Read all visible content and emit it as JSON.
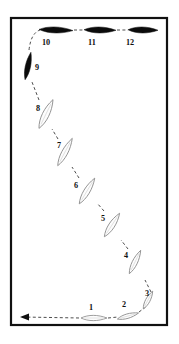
{
  "figure": {
    "title": "",
    "frame": {
      "x": 11,
      "y": 18,
      "width": 156,
      "height": 307,
      "border_color": "#111111",
      "background_color": "#ffffff"
    },
    "style": {
      "open_fill": "#fdfdfd",
      "open_stroke": "#8e8e8e",
      "solid_fill": "#0b0b0b",
      "connector_color": "#3a3a3a",
      "label_color": "#101010"
    },
    "direction_arrow": {
      "name": "flow-arrow",
      "points_to": "left",
      "tip_x": 20,
      "tip_y": 317,
      "tail_x": 46,
      "tail_y": 317
    },
    "items": [
      {
        "id": 1,
        "label": "1",
        "type": "open",
        "cx": 94,
        "cy": 318,
        "length": 26,
        "width": 7,
        "angle": 0,
        "label_x": 89,
        "label_y": 310
      },
      {
        "id": 2,
        "label": "2",
        "type": "open",
        "cx": 128,
        "cy": 316,
        "length": 22,
        "width": 6,
        "angle": -16,
        "label_x": 122,
        "label_y": 307
      },
      {
        "id": 3,
        "label": "3",
        "type": "open",
        "cx": 148,
        "cy": 300,
        "length": 20,
        "width": 6,
        "angle": -62,
        "label_x": 145,
        "label_y": 296
      },
      {
        "id": 4,
        "label": "4",
        "type": "open",
        "cx": 135,
        "cy": 262,
        "length": 26,
        "width": 7,
        "angle": -64,
        "label_x": 124,
        "label_y": 258
      },
      {
        "id": 5,
        "label": "5",
        "type": "open",
        "cx": 112,
        "cy": 225,
        "length": 28,
        "width": 8,
        "angle": -57,
        "label_x": 101,
        "label_y": 221
      },
      {
        "id": 6,
        "label": "6",
        "type": "open",
        "cx": 87,
        "cy": 191,
        "length": 30,
        "width": 8,
        "angle": -59,
        "label_x": 74,
        "label_y": 188
      },
      {
        "id": 7,
        "label": "7",
        "type": "open",
        "cx": 65,
        "cy": 152,
        "length": 31,
        "width": 8,
        "angle": -62,
        "label_x": 57,
        "label_y": 148
      },
      {
        "id": 8,
        "label": "8",
        "type": "open",
        "cx": 46,
        "cy": 114,
        "length": 32,
        "width": 9,
        "angle": -64,
        "label_x": 36,
        "label_y": 111
      },
      {
        "id": 9,
        "label": "9",
        "type": "solid",
        "cx": 28,
        "cy": 66,
        "length": 28,
        "width": 7,
        "angle": -78,
        "label_x": 35,
        "label_y": 70
      },
      {
        "id": 10,
        "label": "10",
        "type": "solid",
        "cx": 56,
        "cy": 30,
        "length": 34,
        "width": 8,
        "angle": 2,
        "label_x": 42,
        "label_y": 45
      },
      {
        "id": 11,
        "label": "11",
        "type": "solid",
        "cx": 100,
        "cy": 30,
        "length": 32,
        "width": 8,
        "angle": 1,
        "label_x": 88,
        "label_y": 45
      },
      {
        "id": 12,
        "label": "12",
        "type": "solid",
        "cx": 143,
        "cy": 30,
        "length": 30,
        "width": 8,
        "angle": 1,
        "label_x": 126,
        "label_y": 45
      }
    ],
    "connectors": [
      {
        "name": "connector-arrow-to-1",
        "d": "M 22 317 L 80 318"
      },
      {
        "name": "connector-1-to-2",
        "d": "M 108 318 L 118 317"
      },
      {
        "name": "connector-2-to-3",
        "d": "M 139 312 L 147 306"
      },
      {
        "name": "connector-3-to-4",
        "d": "M 151 292 L 145 280"
      },
      {
        "name": "connector-4-to-5",
        "d": "M 128 249 L 121 240"
      },
      {
        "name": "connector-5-to-6",
        "d": "M 104 211 L 97 203"
      },
      {
        "name": "connector-6-to-7",
        "d": "M 79 178 L 72 167"
      },
      {
        "name": "connector-7-to-8",
        "d": "M 58 139 L 52 129"
      },
      {
        "name": "connector-8-to-9",
        "d": "M 39 100 L 32 82"
      },
      {
        "name": "connector-9-to-10",
        "d": "M 29 50 Q 31 33 40 30"
      },
      {
        "name": "connector-10-to-11",
        "d": "M 74 30 L 84 30"
      },
      {
        "name": "connector-11-to-12",
        "d": "M 117 30 L 128 30"
      }
    ]
  }
}
